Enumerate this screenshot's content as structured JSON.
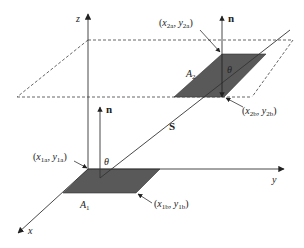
{
  "diagram": {
    "axes": {
      "x": "x",
      "y": "y",
      "z": "z"
    },
    "surfaces": {
      "a1": {
        "name": "A",
        "sub": "1"
      },
      "a2": {
        "name": "A",
        "sub": "2"
      }
    },
    "vectors": {
      "normal": "n",
      "separation": "S"
    },
    "angles": {
      "theta": "θ"
    },
    "corner_labels": {
      "p1a": {
        "x": "x",
        "xs": "1a",
        "y": "y",
        "ys": "1a"
      },
      "p1b": {
        "x": "x",
        "xs": "1b",
        "y": "y",
        "ys": "1b"
      },
      "p2a": {
        "x": "x",
        "xs": "2a",
        "y": "y",
        "ys": "2a"
      },
      "p2b": {
        "x": "x",
        "xs": "2b",
        "y": "y",
        "ys": "2b"
      }
    },
    "punct": {
      "open": "(",
      "comma": ", ",
      "close": ")"
    },
    "colors": {
      "line": "#333333",
      "surface_fill": "#595959",
      "dashed_plane": "#555555"
    }
  }
}
